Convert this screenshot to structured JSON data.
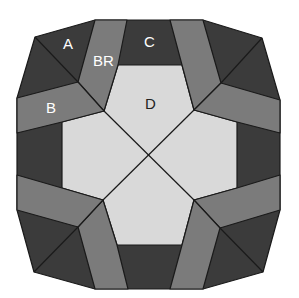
{
  "diagram": {
    "colors": {
      "dark": "#3b3b3b",
      "medium": "#7b7b7b",
      "light": "#d9d9d9",
      "stroke": "#1a1a1a",
      "label_on_dark": "#ffffff",
      "label_on_light": "#222222"
    },
    "labels": {
      "A": "A",
      "BR": "BR",
      "B": "B",
      "C": "C",
      "D": "D"
    }
  }
}
